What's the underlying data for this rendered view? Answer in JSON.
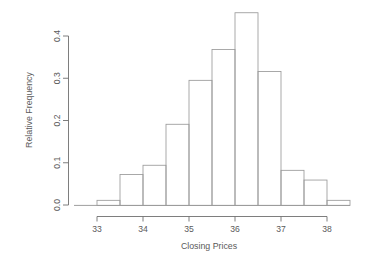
{
  "chart_data": {
    "type": "bar",
    "title": "",
    "subtitle": "",
    "xlabel": "Closing Prices",
    "ylabel": "Relative Frequency",
    "grid": false,
    "legend": null,
    "legend_position": "none",
    "xlim": [
      32.9,
      38.6
    ],
    "ylim": [
      0.0,
      0.48
    ],
    "x_tick_labels": [
      "33",
      "34",
      "35",
      "36",
      "37",
      "38"
    ],
    "x_tick_values": [
      33,
      34,
      35,
      36,
      37,
      38
    ],
    "y_tick_labels": [
      "0.0",
      "0.1",
      "0.2",
      "0.3",
      "0.4"
    ],
    "y_tick_values": [
      0.0,
      0.1,
      0.2,
      0.3,
      0.4
    ],
    "bin_width": 0.5,
    "bin_edges": [
      33.0,
      33.5,
      34.0,
      34.5,
      35.0,
      35.5,
      36.0,
      36.5,
      37.0,
      37.5,
      38.0,
      38.5
    ],
    "categories": [
      "33.0-33.5",
      "33.5-34.0",
      "34.0-34.5",
      "34.5-35.0",
      "35.0-35.5",
      "35.5-36.0",
      "36.0-36.5",
      "36.5-37.0",
      "37.0-37.5",
      "37.5-38.0",
      "38.0-38.5"
    ],
    "values": [
      0.012,
      0.073,
      0.095,
      0.192,
      0.296,
      0.369,
      0.456,
      0.317,
      0.083,
      0.06,
      0.012
    ],
    "bar_fill": "#ffffff",
    "bar_stroke": "#9a9a9a",
    "axis_color": "#6f6f6f",
    "text_color": "#5a5a5a",
    "background": "#ffffff",
    "annotations": []
  },
  "figure": {
    "xlabel": "Closing Prices",
    "ylabel": "Relative Frequency"
  }
}
